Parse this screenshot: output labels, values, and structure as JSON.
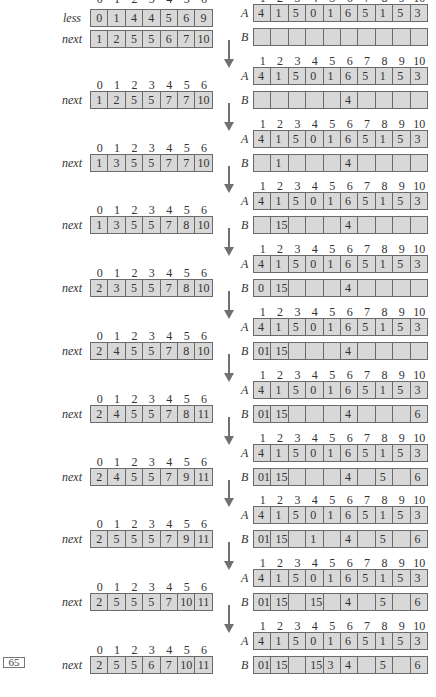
{
  "page_number": "65",
  "labels": {
    "less": "less",
    "next": "next",
    "A": "A",
    "B": "B"
  },
  "left_indices": [
    "0",
    "1",
    "2",
    "3",
    "4",
    "5",
    "6"
  ],
  "right_indices": [
    "1",
    "2",
    "3",
    "4",
    "5",
    "6",
    "7",
    "8",
    "9",
    "10"
  ],
  "less": [
    "0",
    "1",
    "4",
    "4",
    "5",
    "6",
    "9"
  ],
  "A": [
    "4",
    "1",
    "5",
    "0",
    "1",
    "6",
    "5",
    "1",
    "5",
    "3"
  ],
  "steps": [
    {
      "next": [
        "1",
        "2",
        "5",
        "5",
        "6",
        "7",
        "10"
      ],
      "B": [
        "",
        "",
        "",
        "",
        "",
        "",
        "",
        "",
        "",
        ""
      ]
    },
    {
      "next": [
        "1",
        "2",
        "5",
        "5",
        "7",
        "7",
        "10"
      ],
      "B": [
        "",
        "",
        "",
        "",
        "",
        "4",
        "",
        "",
        "",
        ""
      ]
    },
    {
      "next": [
        "1",
        "3",
        "5",
        "5",
        "7",
        "7",
        "10"
      ],
      "B": [
        "",
        "1",
        "",
        "",
        "",
        "4",
        "",
        "",
        "",
        ""
      ]
    },
    {
      "next": [
        "1",
        "3",
        "5",
        "5",
        "7",
        "8",
        "10"
      ],
      "B": [
        "",
        "15",
        "",
        "",
        "",
        "4",
        "",
        "",
        "",
        ""
      ]
    },
    {
      "next": [
        "2",
        "3",
        "5",
        "5",
        "7",
        "8",
        "10"
      ],
      "B": [
        "0",
        "15",
        "",
        "",
        "",
        "4",
        "",
        "",
        "",
        ""
      ]
    },
    {
      "next": [
        "2",
        "4",
        "5",
        "5",
        "7",
        "8",
        "10"
      ],
      "B": [
        "01",
        "15",
        "",
        "",
        "",
        "4",
        "",
        "",
        "",
        ""
      ]
    },
    {
      "next": [
        "2",
        "4",
        "5",
        "5",
        "7",
        "8",
        "11"
      ],
      "B": [
        "01",
        "15",
        "",
        "",
        "",
        "4",
        "",
        "",
        "",
        "6"
      ]
    },
    {
      "next": [
        "2",
        "4",
        "5",
        "5",
        "7",
        "9",
        "11"
      ],
      "B": [
        "01",
        "15",
        "",
        "",
        "",
        "4",
        "",
        "5",
        "",
        "6"
      ]
    },
    {
      "next": [
        "2",
        "5",
        "5",
        "5",
        "7",
        "9",
        "11"
      ],
      "B": [
        "01",
        "15",
        "",
        "1",
        "",
        "4",
        "",
        "5",
        "",
        "6"
      ]
    },
    {
      "next": [
        "2",
        "5",
        "5",
        "5",
        "7",
        "10",
        "11"
      ],
      "B": [
        "01",
        "15",
        "",
        "15",
        "",
        "4",
        "",
        "5",
        "",
        "6"
      ]
    },
    {
      "next": [
        "2",
        "5",
        "5",
        "6",
        "7",
        "10",
        "11"
      ],
      "B": [
        "01",
        "15",
        "",
        "15",
        "3",
        "4",
        "",
        "5",
        "",
        "6"
      ]
    }
  ],
  "colors": {
    "cell_fill": "#d8d8d8",
    "cell_border": "#6a6a6a",
    "arrow": "#707070",
    "background": "#ffffff"
  }
}
